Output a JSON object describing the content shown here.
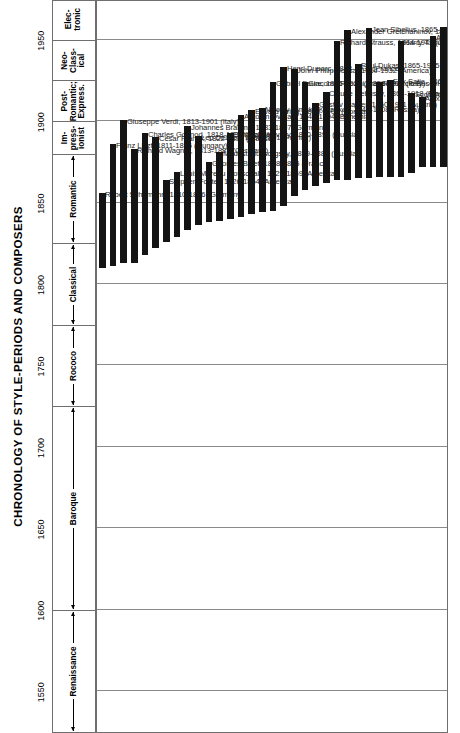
{
  "header": {
    "title": "CHRONOLOGY OF STYLE-PERIODS AND COMPOSERS"
  },
  "axis": {
    "label": "",
    "ticks": [
      "1550",
      "1600",
      "1650",
      "1700",
      "1750",
      "1800",
      "1850",
      "1900",
      "1950"
    ],
    "min": 1525,
    "max": 1975
  },
  "periods": [
    {
      "name": "Renaissance",
      "start": 1525,
      "end": 1600,
      "style": "wide"
    },
    {
      "name": "Baroque",
      "start": 1600,
      "end": 1725,
      "style": "wide"
    },
    {
      "name": "Rococo",
      "start": 1725,
      "end": 1775,
      "style": "wide"
    },
    {
      "name": "Classical",
      "start": 1775,
      "end": 1825,
      "style": "wide"
    },
    {
      "name": "Romantic",
      "start": 1825,
      "end": 1880,
      "style": "wide"
    },
    {
      "name": "Im-\npress-\nionist",
      "start": 1880,
      "end": 1900,
      "style": "stack"
    },
    {
      "name": "Post-\nRomantic;\nExpress.",
      "start": 1900,
      "end": 1925,
      "style": "stack"
    },
    {
      "name": "Neo-\nClass-\nical",
      "start": 1925,
      "end": 1950,
      "style": "stack"
    },
    {
      "name": "Elec-\ntronic",
      "start": 1950,
      "end": 1975,
      "style": "stack"
    }
  ],
  "chart_data": {
    "type": "bar",
    "title": "CHRONOLOGY OF STYLE-PERIODS AND COMPOSERS",
    "xlabel": "",
    "ylabel": "Year",
    "ylim": [
      1525,
      1975
    ],
    "grid": true,
    "legend": "none",
    "note": "Each bar spans one composer's lifespan along the year axis.",
    "categories": [
      "Robert Schumann",
      "Franz Liszt",
      "Giuseppe Verdi",
      "Richard Wagner",
      "Charles Gounod",
      "Cesar Franck",
      "Stephen Foster",
      "Louis Moreau Gottschalk",
      "Johannes Brahms",
      "Leo Delibes",
      "Georges Bizet",
      "Modest Mussorgsky",
      "Piotr Tchaikovsky",
      "Antonin Dvorak",
      "Edvard Grieg",
      "Nikolay Rimsky-Korsakov",
      "Gabriel Faure",
      "Henri Duparc",
      "John Philip Sousa",
      "Giacomo Puccini",
      "Gustav Mahler",
      "Claude Debussy",
      "Richard Strauss",
      "Alexander Gretchaninov",
      "Paul Dukas",
      "Jean Sibelius",
      "Ferruccio Busoni",
      "Erik Satie",
      "Harry T. Burleigh",
      "Scott Joplin",
      "Alexander Scriabin",
      "Arthur Farwell",
      "Ralph Vaughan Williams"
    ],
    "composers": [
      {
        "label": "Robert Schumann, 1810-1856 (Germany)",
        "born": 1810,
        "died": 1856,
        "country": "Germany"
      },
      {
        "label": "Franz Liszt, 1811-1886 (Hungary)",
        "born": 1811,
        "died": 1886,
        "country": "Hungary"
      },
      {
        "label": "Giuseppe Verdi, 1813-1901 (Italy)",
        "born": 1813,
        "died": 1901,
        "country": "Italy"
      },
      {
        "label": "Richard Wagner, 1813-1883 (Germany)",
        "born": 1813,
        "died": 1883,
        "country": "Germany"
      },
      {
        "label": "Charles Gounod, 1818-1893 (France)",
        "born": 1818,
        "died": 1893,
        "country": "France"
      },
      {
        "label": "Cesar Franck, 1822-1890 (France)",
        "born": 1822,
        "died": 1890,
        "country": "France"
      },
      {
        "label": "Stephen Foster, 1826-1864 (America)",
        "born": 1826,
        "died": 1864,
        "country": "America"
      },
      {
        "label": "Louis Moreau Gottschalk, 1829-1869 (America)",
        "born": 1829,
        "died": 1869,
        "country": "America"
      },
      {
        "label": "Johannes Brahms, 1833-1897 (Germany)",
        "born": 1833,
        "died": 1897,
        "country": "Germany"
      },
      {
        "label": "Leo Delibes, 1836-1891 (France)",
        "born": 1836,
        "died": 1891,
        "country": "France"
      },
      {
        "label": "Georges Bizet, 1838-1875 (France)",
        "born": 1838,
        "died": 1875,
        "country": "France"
      },
      {
        "label": "Modest Mussorgsky, 1839-1881 (Russia)",
        "born": 1839,
        "died": 1881,
        "country": "Russia"
      },
      {
        "label": "Piotr Tchaikovsky, 1840-1893 (Russia)",
        "born": 1840,
        "died": 1893,
        "country": "Russia"
      },
      {
        "label": "Antonin Dvorak, 1841-1904 (Bohemia)",
        "born": 1841,
        "died": 1904,
        "country": "Bohemia"
      },
      {
        "label": "Edvard Grieg, 1843-1907 (Norway)",
        "born": 1843,
        "died": 1907,
        "country": "Norway"
      },
      {
        "label": "Nikolay Rimsky-Korsakov, 1844-1908 (Russia)",
        "born": 1844,
        "died": 1908,
        "country": "Russia"
      },
      {
        "label": "Gabriel Faure, 1845-1924 (France)",
        "born": 1845,
        "died": 1924,
        "country": "France"
      },
      {
        "label": "Henri Duparc, 1848-1933 (France)",
        "born": 1848,
        "died": 1933,
        "country": "France"
      },
      {
        "label": "John Philip Sousa, 1854-1932 (America)",
        "born": 1854,
        "died": 1932,
        "country": "America"
      },
      {
        "label": "Giacomo Puccini, 1858-1924 (Italy)",
        "born": 1858,
        "died": 1924,
        "country": "Italy"
      },
      {
        "label": "Gustav Mahler, 1860-1911 (Austria)",
        "born": 1860,
        "died": 1911,
        "country": "Austria"
      },
      {
        "label": "Claude Debussy, 1862-1918 (France)",
        "born": 1862,
        "died": 1918,
        "country": "France"
      },
      {
        "label": "Richard Strauss, 1864-1949 (Germany)",
        "born": 1864,
        "died": 1949,
        "country": "Germany"
      },
      {
        "label": "Alexander Gretchaninov, 1864-1956 (Russia)",
        "born": 1864,
        "died": 1956,
        "country": "Russia"
      },
      {
        "label": "Paul Dukas, 1865-1935 (France)",
        "born": 1865,
        "died": 1935,
        "country": "France"
      },
      {
        "label": "Jean Sibelius, 1865-1957 (Finland)",
        "born": 1865,
        "died": 1957,
        "country": "Finland"
      },
      {
        "label": "Ferruccio Busoni, 1866-1924 (Italy)",
        "born": 1866,
        "died": 1924,
        "country": "Italy"
      },
      {
        "label": "Erik Satie, 1866-1925 (France)",
        "born": 1866,
        "died": 1925,
        "country": "France"
      },
      {
        "label": "Harry T. Burleigh, 1866-1949 (America)",
        "born": 1866,
        "died": 1949,
        "country": "America"
      },
      {
        "label": "Scott Joplin, 1868-1917 (America)",
        "born": 1868,
        "died": 1917,
        "country": "America"
      },
      {
        "label": "Alexander Scriabin, 1872-1915 (Russia)",
        "born": 1872,
        "died": 1915,
        "country": "Russia"
      },
      {
        "label": "Arthur Farwell, 1872-1952 (America)",
        "born": 1872,
        "died": 1952,
        "country": "America"
      },
      {
        "label": "Ralph Vaughan Williams, 1872-1958 (England)",
        "born": 1872,
        "died": 1958,
        "country": "England"
      }
    ]
  },
  "colors": {
    "bar": "#141414",
    "grid": "#8a8a8a",
    "border": "#6f6f6f",
    "text": "#000000",
    "background": "#ffffff"
  }
}
